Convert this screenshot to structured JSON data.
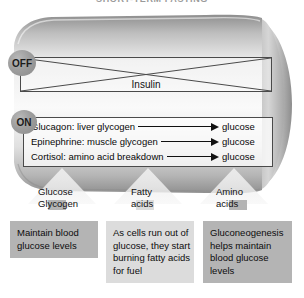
{
  "title": "SHORT-TERM FASTING",
  "colors": {
    "cylinder_light": "#f2f2f2",
    "cylinder_mid": "#c8c8c8",
    "cylinder_dark": "#9a9a9a",
    "badge_gray": "#9e9e9e",
    "box_dark": "#b4b4b4",
    "box_light": "#dcdcdc",
    "outline": "#4a4a4a",
    "text": "#111111"
  },
  "hormone_panels": {
    "off": {
      "badge": "OFF",
      "label": "Insulin",
      "crossed_out": true
    },
    "on": {
      "badge": "ON",
      "rows": [
        {
          "source": "Glucagon: liver glycogen",
          "arrow": "right-arrow",
          "product": "glucose"
        },
        {
          "source": "Epinephrine: muscle glycogen",
          "arrow": "right-arrow",
          "product": "glucose"
        },
        {
          "source": "Cortisol: amino acid breakdown",
          "arrow": "right-arrow",
          "product": "glucose"
        }
      ]
    }
  },
  "outputs": [
    {
      "label_lines": [
        "Glucose",
        "Glycogen"
      ],
      "result_lines": [
        "Maintain blood",
        "glucose levels"
      ]
    },
    {
      "label_lines": [
        "Fatty",
        "acids"
      ],
      "result_lines": [
        "As cells run out of",
        "glucose, they start",
        "burning fatty acids",
        "for fuel"
      ]
    },
    {
      "label_lines": [
        "Amino",
        "acids"
      ],
      "result_lines": [
        "Gluconeogenesis",
        "helps maintain",
        "blood glucose",
        "levels"
      ]
    }
  ]
}
